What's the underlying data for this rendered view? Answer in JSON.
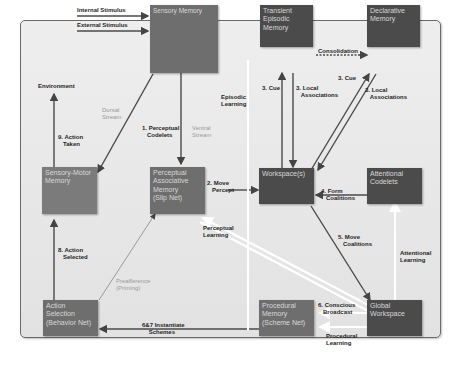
{
  "diagram": {
    "nodes": {
      "sensory_memory": "Sensory Memory",
      "transient_episodic_memory": "Transient\nEpisodic\nMemory",
      "declarative_memory": "Declarative\nMemory",
      "sensory_motor_memory": "Sensory-Motor\nMemory",
      "perceptual_associative_memory": "Perceptual\nAssociative\nMemory\n(Slip Net)",
      "workspace": "Workspace(s)",
      "attentional_codelets": "Attentional\nCodelets",
      "action_selection": "Action\nSelection\n(Behavior Net)",
      "procedural_memory": "Procedural\nMemory\n(Scheme Net)",
      "global_workspace": "Global\nWorkspace"
    },
    "labels": {
      "internal_stimulus": "Internal Stimulus",
      "external_stimulus": "External Stimulus",
      "environment": "Environment",
      "dorsal_stream": "Dorsal\nStream",
      "ventral_stream": "Ventral\nStream",
      "perceptual_codelets": "1. Perceptual\n   Codelets",
      "action_taken": "9. Action\n   Taken",
      "episodic_learning": "Episodic\nLearning",
      "cue_teml": "3. Cue",
      "local_assoc_teml": "3. Local\n   Associations",
      "consolidation": "Consolidation",
      "cue_dm": "3. Cue",
      "local_assoc_dm": "3. Local\n   Associations",
      "move_percept": "2. Move\n   Percept",
      "perceptual_learning": "Perceptual\nLearning",
      "form_coalitions": "4. Form\n   Coalitions",
      "move_coalitions": "5. Move\n   Coalitions",
      "attentional_learning": "Attentional\nLearning",
      "action_selected": "8. Action\n   Selected",
      "preafference": "Preafference\n(Priming)",
      "instantiate_schemes": "6&7 Instantiate\n    Schemes",
      "conscious_broadcast": "6. Conscious\n   Broadcast",
      "procedural_learning": "Procedural\nLearning"
    }
  }
}
